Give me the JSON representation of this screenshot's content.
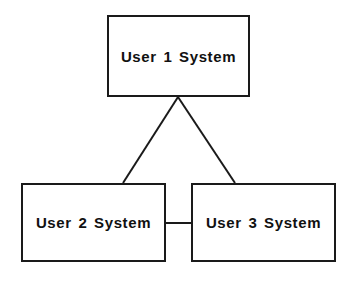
{
  "diagram": {
    "type": "node-link-diagram",
    "canvas": {
      "width": 352,
      "height": 283,
      "background": "#ffffff"
    },
    "style": {
      "line_color": "#1a1a1a",
      "line_width": 2,
      "text_color": "#111111"
    },
    "nodes": [
      {
        "id": "user1",
        "label": "User 1 System",
        "shape": "rectangle",
        "x": 107,
        "y": 15,
        "width": 143,
        "height": 82
      },
      {
        "id": "user2",
        "label": "User 2 System",
        "shape": "rectangle",
        "x": 21,
        "y": 183,
        "width": 145,
        "height": 79
      },
      {
        "id": "user3",
        "label": "User 3 System",
        "shape": "rectangle",
        "x": 191,
        "y": 183,
        "width": 145,
        "height": 79
      }
    ],
    "edges": [
      {
        "id": "edge-user1-user2",
        "from": "user1",
        "to": "user2",
        "kind": "diagonal-line",
        "points": [
          [
            178,
            97
          ],
          [
            123,
            183
          ]
        ]
      },
      {
        "id": "edge-user1-user3",
        "from": "user1",
        "to": "user3",
        "kind": "diagonal-line",
        "points": [
          [
            178,
            97
          ],
          [
            235,
            183
          ]
        ]
      },
      {
        "id": "edge-user2-user3",
        "from": "user2",
        "to": "user3",
        "kind": "horizontal-line",
        "points": [
          [
            166,
            223
          ],
          [
            191,
            223
          ]
        ]
      }
    ]
  }
}
